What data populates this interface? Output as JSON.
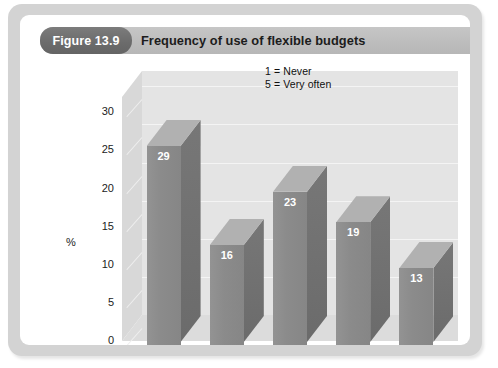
{
  "figure": {
    "label": "Figure 13.9",
    "title": "Frequency of use of flexible budgets"
  },
  "legend": {
    "line1": "1 = Never",
    "line2": "5 = Very often"
  },
  "colors": {
    "frame": "#d3d3d3",
    "panel": "#ffffff",
    "header_band": "#bfbfbf",
    "pill": "#6e6e6e",
    "bar_front": "#8c8c8c",
    "bar_side": "#6f6f6f",
    "bar_top": "#b1b1b1",
    "back_wall": "#e4e4e4",
    "floor": "#dcdcdc",
    "gridline": "#f4f4f4",
    "text": "#1c1c1c"
  },
  "chart_data": {
    "type": "bar",
    "title": "Frequency of use of flexible budgets",
    "subtitle": "",
    "xlabel": "Scale",
    "ylabel": "%",
    "categories": [
      "1",
      "2",
      "3",
      "4",
      "5"
    ],
    "values": [
      29,
      16,
      23,
      19,
      13
    ],
    "data_labels": [
      "29",
      "16",
      "23",
      "19",
      "13"
    ],
    "ylim": [
      0,
      32
    ],
    "yticks": [
      0,
      5,
      10,
      15,
      20,
      25,
      30
    ],
    "ytick_labels": [
      "0",
      "5",
      "10",
      "15",
      "20",
      "25",
      "30"
    ],
    "xtick_labels": [
      "1",
      "2",
      "3",
      "4",
      "5"
    ],
    "grid": true,
    "grid_axis": "y",
    "legend_position": "inside-top-right",
    "legend_entries": [
      "1 = Never",
      "5 = Very often"
    ],
    "three_d": true,
    "series": [
      {
        "name": "Frequency of use",
        "values": [
          29,
          16,
          23,
          19,
          13
        ]
      }
    ]
  }
}
